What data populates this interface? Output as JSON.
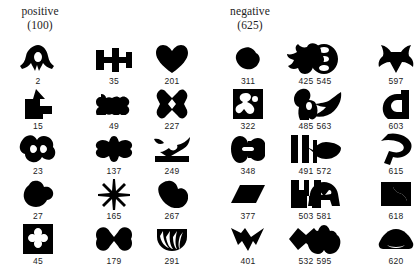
{
  "figure": {
    "type": "stimulus-grid",
    "background_color": "#ffffff",
    "ink_color": "#000000",
    "columns": 7,
    "rows": 5,
    "column_x_centers": [
      38,
      114,
      172,
      248,
      306,
      324,
      396
    ]
  },
  "headings": {
    "positive": {
      "word": "positive",
      "count": "(100)"
    },
    "negative": {
      "word": "negative",
      "count": "(625)"
    }
  },
  "grid": {
    "rows": [
      {
        "cells": [
          {
            "label": "2",
            "shape": "arrowhead-crest-blob",
            "group": "positive"
          },
          {
            "label": "35",
            "shape": "barbell-cross-blob",
            "group": "negative"
          },
          {
            "label": "201",
            "shape": "heart-blob",
            "group": "negative"
          },
          {
            "label": "311",
            "shape": "small-lumpy-blob",
            "group": "negative"
          },
          {
            "label": "425",
            "shape": "bird-splash-blob",
            "group": "negative"
          },
          {
            "label": "545",
            "shape": "figure-eight-ring-blob",
            "group": "negative"
          },
          {
            "label": "597",
            "shape": "four-point-star-blob",
            "group": "negative"
          }
        ]
      },
      {
        "cells": [
          {
            "label": "15",
            "shape": "up-arrow-step-blob",
            "group": "positive"
          },
          {
            "label": "49",
            "shape": "bone-dumbbell-blob",
            "group": "negative"
          },
          {
            "label": "227",
            "shape": "square-x-cutout-blob",
            "group": "negative"
          },
          {
            "label": "322",
            "shape": "square-holes-blob",
            "group": "negative"
          },
          {
            "label": "485",
            "shape": "keyhole-figure-blob",
            "group": "negative"
          },
          {
            "label": "563",
            "shape": "wing-hook-blob",
            "group": "negative"
          },
          {
            "label": "603",
            "shape": "c-bracket-blob",
            "group": "negative"
          }
        ]
      },
      {
        "cells": [
          {
            "label": "23",
            "shape": "double-lobe-rough-blob",
            "group": "positive"
          },
          {
            "label": "137",
            "shape": "plus-winged-blob",
            "group": "negative"
          },
          {
            "label": "249",
            "shape": "bird-on-branch-blob",
            "group": "negative"
          },
          {
            "label": "348",
            "shape": "split-kidney-blob",
            "group": "negative"
          },
          {
            "label": "491",
            "shape": "vertical-bars-blob",
            "group": "negative"
          },
          {
            "label": "572",
            "shape": "leaf-blob",
            "group": "negative"
          },
          {
            "label": "615",
            "shape": "p-loop-blob",
            "group": "negative"
          }
        ]
      },
      {
        "cells": [
          {
            "label": "27",
            "shape": "mushroom-lump-blob",
            "group": "positive"
          },
          {
            "label": "165",
            "shape": "asterisk-star-blob",
            "group": "negative"
          },
          {
            "label": "267",
            "shape": "rounded-spiral-blob",
            "group": "negative"
          },
          {
            "label": "377",
            "shape": "slanted-bar-blob",
            "group": "negative"
          },
          {
            "label": "503",
            "shape": "comb-bracket-blob",
            "group": "negative"
          },
          {
            "label": "581",
            "shape": "mask-eyes-blob",
            "group": "negative"
          },
          {
            "label": "618",
            "shape": "animal-silhouette-blob",
            "group": "negative"
          }
        ]
      },
      {
        "cells": [
          {
            "label": "45",
            "shape": "square-clover-cutout",
            "group": "positive"
          },
          {
            "label": "179",
            "shape": "bowtie-butterfly-blob",
            "group": "negative"
          },
          {
            "label": "291",
            "shape": "shell-fan-blob",
            "group": "negative"
          },
          {
            "label": "401",
            "shape": "zigzag-ribbon-blob",
            "group": "negative"
          },
          {
            "label": "532",
            "shape": "double-diamond-blob",
            "group": "negative"
          },
          {
            "label": "595",
            "shape": "lungs-tree-blob",
            "group": "negative"
          },
          {
            "label": "620",
            "shape": "dome-mound-blob",
            "group": "negative"
          }
        ]
      }
    ]
  }
}
